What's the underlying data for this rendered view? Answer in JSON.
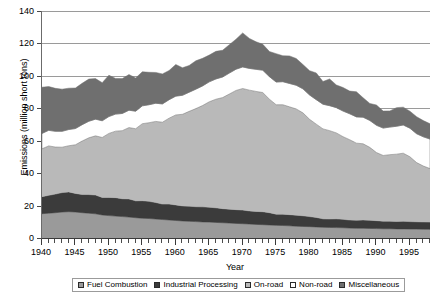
{
  "chart_data": {
    "type": "area",
    "stacked": true,
    "title": "",
    "xlabel": "Year",
    "ylabel": "Emissions (million short tons)",
    "xlim": [
      1940,
      1998
    ],
    "ylim": [
      0,
      140
    ],
    "ytick_step": 20,
    "yticks": [
      0,
      20,
      40,
      60,
      80,
      100,
      120,
      140
    ],
    "xticks": [
      1940,
      1945,
      1950,
      1955,
      1960,
      1965,
      1970,
      1975,
      1980,
      1985,
      1990,
      1995
    ],
    "xtick_minor_step": 1,
    "grid": "horizontal",
    "legend_position": "bottom",
    "x": [
      1940,
      1941,
      1942,
      1943,
      1944,
      1945,
      1946,
      1947,
      1948,
      1949,
      1950,
      1951,
      1952,
      1953,
      1954,
      1955,
      1956,
      1957,
      1958,
      1959,
      1960,
      1961,
      1962,
      1963,
      1964,
      1965,
      1966,
      1967,
      1968,
      1969,
      1970,
      1971,
      1972,
      1973,
      1974,
      1975,
      1976,
      1977,
      1978,
      1979,
      1980,
      1981,
      1982,
      1983,
      1984,
      1985,
      1986,
      1987,
      1988,
      1989,
      1990,
      1991,
      1992,
      1993,
      1994,
      1995,
      1996,
      1997,
      1998
    ],
    "series": [
      {
        "name": "Fuel Combustion",
        "color": "#9a9a9a",
        "values": [
          15.0,
          15.3,
          15.6,
          16.0,
          16.2,
          16.0,
          15.6,
          15.3,
          14.9,
          14.2,
          13.8,
          13.5,
          13.2,
          12.9,
          12.5,
          12.2,
          12.0,
          11.7,
          11.4,
          11.1,
          10.8,
          10.5,
          10.3,
          10.1,
          9.9,
          9.8,
          9.6,
          9.4,
          9.2,
          9.0,
          8.8,
          8.6,
          8.4,
          8.2,
          8.0,
          7.8,
          7.7,
          7.5,
          7.3,
          7.1,
          7.0,
          6.8,
          6.6,
          6.5,
          6.4,
          6.3,
          6.1,
          6.0,
          6.0,
          5.9,
          5.8,
          5.7,
          5.7,
          5.6,
          5.6,
          5.5,
          5.5,
          5.4,
          5.4
        ]
      },
      {
        "name": "Industrial Processing",
        "color": "#3b3b3b",
        "values": [
          10.5,
          11.0,
          11.5,
          12.0,
          12.2,
          11.5,
          11.2,
          11.5,
          11.6,
          10.8,
          11.2,
          11.4,
          11.0,
          11.2,
          10.4,
          10.8,
          10.6,
          10.2,
          9.5,
          9.8,
          9.6,
          9.3,
          9.3,
          9.2,
          9.3,
          9.2,
          9.0,
          8.7,
          8.6,
          8.5,
          8.4,
          8.1,
          8.0,
          8.0,
          7.6,
          6.9,
          7.0,
          6.9,
          6.8,
          6.6,
          6.2,
          5.9,
          5.2,
          5.2,
          5.4,
          5.2,
          5.0,
          5.0,
          5.1,
          5.0,
          4.9,
          4.7,
          4.7,
          4.6,
          4.7,
          4.6,
          4.5,
          4.5,
          4.4
        ]
      },
      {
        "name": "On-road",
        "color": "#b9b9b9",
        "values": [
          29.5,
          30.5,
          29.0,
          28.0,
          28.5,
          30.0,
          33.0,
          35.0,
          36.5,
          37.0,
          39.5,
          41.0,
          42.0,
          44.0,
          44.5,
          47.5,
          48.5,
          50.0,
          50.5,
          53.0,
          55.5,
          56.5,
          58.5,
          60.5,
          62.5,
          65.0,
          67.0,
          68.5,
          71.0,
          73.5,
          75.0,
          74.5,
          74.0,
          73.5,
          70.0,
          67.5,
          67.5,
          66.5,
          65.5,
          63.5,
          60.0,
          57.5,
          55.5,
          54.5,
          53.0,
          51.0,
          49.5,
          47.5,
          47.0,
          45.0,
          42.0,
          40.5,
          41.0,
          41.5,
          42.0,
          40.0,
          36.5,
          34.5,
          33.0
        ]
      },
      {
        "name": "Non-road",
        "color": "#ffffff",
        "values": [
          9.5,
          9.6,
          9.7,
          9.8,
          10.0,
          10.0,
          10.1,
          10.2,
          10.3,
          10.3,
          10.4,
          10.5,
          10.6,
          10.7,
          10.8,
          11.0,
          11.1,
          11.2,
          11.3,
          11.4,
          11.6,
          11.7,
          11.8,
          12.0,
          12.1,
          12.3,
          12.5,
          12.7,
          12.9,
          13.1,
          13.3,
          13.4,
          13.6,
          13.8,
          13.9,
          14.0,
          14.2,
          14.4,
          14.6,
          14.8,
          15.0,
          15.1,
          15.2,
          15.4,
          15.6,
          15.8,
          16.0,
          16.2,
          16.4,
          16.6,
          16.8,
          16.9,
          17.0,
          17.2,
          17.4,
          17.6,
          17.8,
          18.0,
          18.2
        ]
      },
      {
        "name": "Miscellaneous",
        "color": "#6f6f6f",
        "values": [
          28.5,
          27.0,
          26.5,
          26.0,
          25.5,
          25.0,
          25.5,
          26.0,
          25.0,
          23.5,
          25.5,
          22.0,
          21.5,
          22.0,
          20.5,
          21.0,
          20.0,
          19.0,
          18.5,
          18.0,
          19.5,
          17.0,
          16.5,
          17.5,
          17.0,
          16.5,
          17.0,
          16.5,
          17.5,
          18.5,
          21.0,
          18.5,
          17.0,
          16.0,
          15.5,
          17.5,
          16.0,
          17.0,
          16.5,
          15.0,
          15.0,
          16.5,
          14.0,
          16.5,
          14.0,
          14.5,
          14.0,
          15.5,
          12.0,
          10.5,
          12.5,
          10.5,
          10.0,
          11.5,
          11.0,
          10.5,
          10.5,
          10.0,
          9.5
        ]
      }
    ],
    "totals": [
      93.0,
      93.4,
      92.3,
      91.8,
      92.4,
      92.5,
      95.4,
      98.0,
      98.3,
      95.8,
      100.4,
      98.4,
      98.3,
      100.8,
      98.7,
      102.5,
      102.2,
      102.1,
      101.2,
      103.3,
      107.0,
      105.0,
      106.4,
      109.3,
      110.8,
      112.8,
      115.1,
      115.8,
      119.2,
      122.6,
      126.5,
      123.1,
      121.0,
      119.5,
      115.0,
      113.7,
      112.4,
      112.3,
      110.7,
      107.0,
      103.2,
      101.8,
      96.5,
      98.1,
      94.4,
      92.8,
      90.6,
      90.2,
      86.5,
      83.0,
      82.0,
      78.3,
      78.4,
      80.4,
      80.7,
      78.2,
      74.8,
      72.4,
      70.5
    ]
  },
  "axes": {
    "y_title": "Emissions (million short tons)",
    "x_title": "Year",
    "y_labels": [
      "0",
      "20",
      "40",
      "60",
      "80",
      "100",
      "120",
      "140"
    ],
    "x_labels": [
      "1940",
      "1945",
      "1950",
      "1955",
      "1960",
      "1965",
      "1970",
      "1975",
      "1980",
      "1985",
      "1990",
      "1995"
    ]
  },
  "legend": {
    "items": [
      {
        "label": "Fuel Combustion",
        "color": "#9a9a9a"
      },
      {
        "label": "Industrial Processing",
        "color": "#3b3b3b"
      },
      {
        "label": "On-road",
        "color": "#b9b9b9"
      },
      {
        "label": "Non-road",
        "color": "#ffffff"
      },
      {
        "label": "Miscellaneous",
        "color": "#6f6f6f"
      }
    ]
  }
}
